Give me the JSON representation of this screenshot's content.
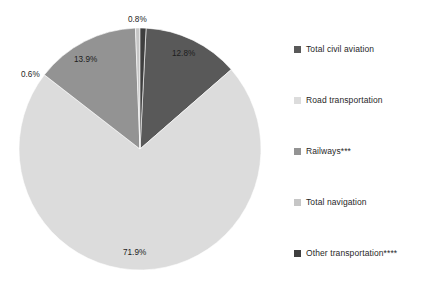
{
  "chart_data": {
    "type": "pie",
    "title": "",
    "subtitle": "",
    "xlabel": "",
    "ylabel": "",
    "grid": false,
    "legend_position": "right",
    "unit": "%",
    "categories": [
      "Total civil aviation",
      "Road transportation",
      "Railways***",
      "Total navigation",
      "Other transportation****"
    ],
    "values": [
      12.8,
      71.9,
      13.9,
      0.6,
      0.8
    ],
    "value_labels": [
      "12.8%",
      "71.9%",
      "13.9%",
      "0.6%",
      "0.8%"
    ],
    "colors": [
      "#595959",
      "#dcdcdc",
      "#939393",
      "#c6c6c6",
      "#3f3f3f"
    ],
    "slices": [
      {
        "name": "Total civil aviation",
        "value": 12.8,
        "label": "12.8%",
        "color": "#595959",
        "start_pct": 0.8,
        "end_pct": 13.6
      },
      {
        "name": "Road transportation",
        "value": 71.9,
        "label": "71.9%",
        "color": "#dcdcdc",
        "start_pct": 13.6,
        "end_pct": 85.5
      },
      {
        "name": "Railways***",
        "value": 13.9,
        "label": "13.9%",
        "color": "#939393",
        "start_pct": 85.5,
        "end_pct": 99.4
      },
      {
        "name": "Total navigation",
        "value": 0.6,
        "label": "0.6%",
        "color": "#c6c6c6",
        "start_pct": 99.4,
        "end_pct": 100.0
      },
      {
        "name": "Other transportation****",
        "value": 0.8,
        "label": "0.8%",
        "color": "#3f3f3f",
        "start_pct": 0.0,
        "end_pct": 0.8
      }
    ]
  },
  "legend": {
    "items": [
      {
        "label": "Total civil aviation",
        "color": "#595959"
      },
      {
        "label": "Road transportation",
        "color": "#dcdcdc"
      },
      {
        "label": "Railways***",
        "color": "#939393"
      },
      {
        "label": "Total navigation",
        "color": "#c6c6c6"
      },
      {
        "label": "Other transportation****",
        "color": "#3f3f3f"
      }
    ]
  },
  "pie_geometry": {
    "center_x": 140,
    "center_y": 149,
    "radius": 121
  },
  "labels": {
    "aviation": "12.8%",
    "road": "71.9%",
    "railways": "13.9%",
    "navigation": "0.6%",
    "other": "0.8%"
  }
}
